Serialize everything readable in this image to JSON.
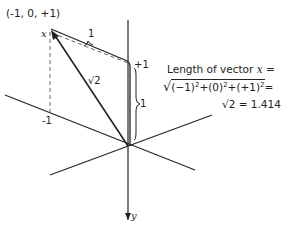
{
  "diagram": {
    "point_label": "(-1, 0, +1)",
    "vector_label": "x",
    "y_axis_label": "y",
    "segment_top_label": "1",
    "segment_right_label": "1",
    "plus_one_label": "+1",
    "minus_one_label": "-1",
    "vector_length_label": "√2",
    "equation": {
      "line1_prefix": "Length of vector",
      "line1_var": "x",
      "line1_suffix": "=",
      "line2_sqrt": "√",
      "line2_term1": "(−1)",
      "line2_term2": "(0)",
      "line2_term3": "(+1)",
      "exponent": "2",
      "plus": "+",
      "equals": "=",
      "line3": "√2 = 1.414"
    },
    "colors": {
      "line": "#222222",
      "dashed": "#555555",
      "background": "#ffffff"
    }
  }
}
